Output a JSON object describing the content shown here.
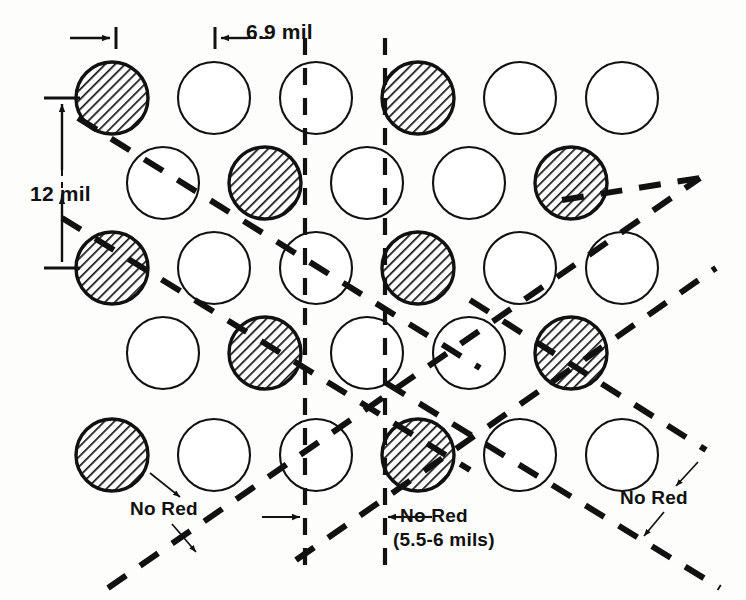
{
  "figure": {
    "background_color": "#fdfdfc",
    "ink_color": "#111111",
    "hatch_color": "#1a1a1a",
    "dot_fill_open": "#ffffff"
  },
  "labels": {
    "vertical_pitch": "12 mil",
    "horizontal_pitch": "6.9 mil",
    "no_red_left": "No Red",
    "no_red_center": "No Red",
    "no_red_center_detail": "(5.5-6 mils)",
    "no_red_right": "No Red"
  },
  "dimensions": {
    "vertical_pitch_value": 12,
    "vertical_pitch_unit": "mil",
    "horizontal_pitch_value": 6.9,
    "horizontal_pitch_unit": "mil",
    "no_red_band_min": 5.5,
    "no_red_band_max": 6,
    "no_red_band_unit": "mils"
  },
  "grid": {
    "dot_radius": 36,
    "column_spacing": 102,
    "row_spacing": 85,
    "odd_row_start_x": 112,
    "even_row_start_x": 163,
    "first_row_y": 98,
    "rows": [
      {
        "index": 1,
        "y": 98,
        "start_x": 112,
        "count": 6,
        "dots": [
          {
            "x": 112,
            "shaded": true
          },
          {
            "x": 214,
            "shaded": false
          },
          {
            "x": 316,
            "shaded": false
          },
          {
            "x": 418,
            "shaded": true
          },
          {
            "x": 520,
            "shaded": false
          },
          {
            "x": 622,
            "shaded": false
          }
        ]
      },
      {
        "index": 2,
        "y": 183,
        "start_x": 163,
        "count": 5,
        "dots": [
          {
            "x": 163,
            "shaded": false
          },
          {
            "x": 265,
            "shaded": true
          },
          {
            "x": 367,
            "shaded": false
          },
          {
            "x": 469,
            "shaded": false
          },
          {
            "x": 571,
            "shaded": true
          }
        ]
      },
      {
        "index": 3,
        "y": 268,
        "start_x": 112,
        "count": 6,
        "dots": [
          {
            "x": 112,
            "shaded": true
          },
          {
            "x": 214,
            "shaded": false
          },
          {
            "x": 316,
            "shaded": false
          },
          {
            "x": 418,
            "shaded": true
          },
          {
            "x": 520,
            "shaded": false
          },
          {
            "x": 622,
            "shaded": false
          }
        ]
      },
      {
        "index": 4,
        "y": 353,
        "start_x": 163,
        "count": 5,
        "dots": [
          {
            "x": 163,
            "shaded": false
          },
          {
            "x": 265,
            "shaded": true
          },
          {
            "x": 367,
            "shaded": false
          },
          {
            "x": 469,
            "shaded": false
          },
          {
            "x": 571,
            "shaded": true
          }
        ]
      },
      {
        "index": 5,
        "y": 455,
        "start_x": 112,
        "count": 6,
        "dots": [
          {
            "x": 112,
            "shaded": true
          },
          {
            "x": 214,
            "shaded": false
          },
          {
            "x": 316,
            "shaded": false
          },
          {
            "x": 418,
            "shaded": true
          },
          {
            "x": 520,
            "shaded": false
          },
          {
            "x": 622,
            "shaded": false
          }
        ]
      }
    ]
  },
  "guide_lines": {
    "vertical_dashed": [
      {
        "name": "left-band-edge",
        "x": 305,
        "y1": 38,
        "y2": 565
      },
      {
        "name": "right-band-edge",
        "x": 385,
        "y1": 38,
        "y2": 565
      }
    ],
    "descending_dashed": [
      {
        "name": "desc-1",
        "x1": 78,
        "y1": 118,
        "x2": 480,
        "y2": 368
      },
      {
        "name": "desc-2",
        "x1": 62,
        "y1": 218,
        "x2": 470,
        "y2": 470
      },
      {
        "name": "desc-3",
        "x1": 386,
        "y1": 383,
        "x2": 720,
        "y2": 588
      },
      {
        "name": "desc-4",
        "x1": 470,
        "y1": 300,
        "x2": 706,
        "y2": 450
      }
    ],
    "ascending_dashed": [
      {
        "name": "asc-1",
        "x1": 108,
        "y1": 588,
        "x2": 700,
        "y2": 178
      },
      {
        "name": "asc-2",
        "x1": 296,
        "y1": 560,
        "x2": 716,
        "y2": 268
      },
      {
        "name": "asc-3",
        "x1": 562,
        "y1": 200,
        "x2": 700,
        "y2": 178
      }
    ]
  },
  "annotations": {
    "arrows": [
      {
        "name": "dot-width-arrow",
        "type": "horizontal",
        "x1": 72,
        "x2": 116,
        "y": 38
      },
      {
        "name": "pitch-arrow",
        "type": "horizontal",
        "x1": 214,
        "x2": 250,
        "y": 38
      },
      {
        "name": "vertical-pitch-arrow",
        "type": "vertical",
        "x": 62,
        "y1": 98,
        "y2": 268
      },
      {
        "name": "band-left-arrow",
        "type": "horizontal",
        "x1": 262,
        "x2": 305,
        "y": 517
      },
      {
        "name": "band-right-arrow",
        "type": "horizontal",
        "x1": 385,
        "x2": 345,
        "y": 517
      }
    ],
    "leaders": [
      {
        "name": "leader-nored-left-up",
        "x1": 175,
        "y1": 495,
        "x2": 152,
        "y2": 478
      },
      {
        "name": "leader-nored-left-down",
        "x1": 168,
        "y1": 523,
        "x2": 190,
        "y2": 548
      },
      {
        "name": "leader-nored-right-up",
        "x1": 672,
        "y1": 484,
        "x2": 690,
        "y2": 463
      },
      {
        "name": "leader-nored-right-down",
        "x1": 660,
        "y1": 512,
        "x2": 642,
        "y2": 533
      }
    ]
  },
  "chart_data": {
    "type": "scatter",
    "xlabel": "",
    "ylabel": "",
    "legend": [
      "shaded dot (red phosphor)",
      "open dot"
    ],
    "categories": [
      "row 1",
      "row 2",
      "row 3",
      "row 4",
      "row 5"
    ],
    "series": [
      {
        "name": "shaded dots per row",
        "values": [
          2,
          2,
          2,
          2,
          2
        ]
      },
      {
        "name": "open dots per row",
        "values": [
          4,
          3,
          4,
          3,
          4
        ]
      }
    ],
    "annotations": [
      "12 mil",
      "6.9 mil",
      "No Red",
      "No Red (5.5-6 mils)",
      "No Red"
    ]
  }
}
